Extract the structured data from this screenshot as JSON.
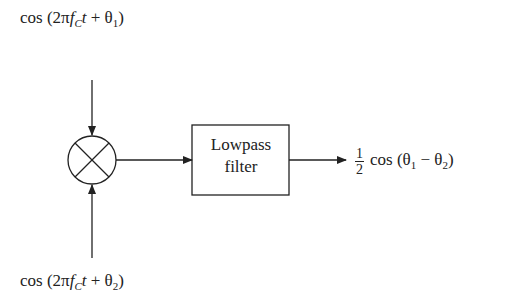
{
  "diagram": {
    "type": "block-diagram",
    "inputs": {
      "top": {
        "prefix": "cos (2π",
        "f": "f",
        "sub_c": "C",
        "t": "t",
        "plus": " + θ",
        "theta_sub": "1",
        "close": ")"
      },
      "bottom": {
        "prefix": "cos (2π",
        "f": "f",
        "sub_c": "C",
        "t": "t",
        "plus": " + θ",
        "theta_sub": "2",
        "close": ")"
      }
    },
    "blocks": {
      "mixer": {
        "symbol": "multiplier",
        "label": "×"
      },
      "filter": {
        "line1": "Lowpass",
        "line2": "filter"
      }
    },
    "output": {
      "frac_num": "1",
      "frac_den": "2",
      "expr_a": "cos (θ",
      "sub1": "1",
      "minus": " − θ",
      "sub2": "2",
      "close": ")"
    },
    "colors": {
      "stroke": "#222222",
      "background": "#ffffff"
    }
  }
}
